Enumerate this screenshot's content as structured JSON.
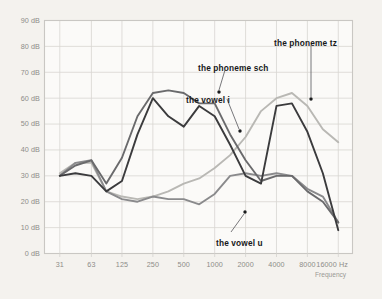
{
  "figure": {
    "background_color": "#f4f2ee",
    "plot_background_color": "#fbfaf8",
    "grid_color": "#d8d6d2",
    "border_color": "#c9c7c3"
  },
  "axes": {
    "y_unit": "dB",
    "y_ticks": [
      "0 dB",
      "10 dB",
      "20 dB",
      "30 dB",
      "40 dB",
      "50 dB",
      "60 dB",
      "70 dB",
      "80 dB",
      "90 dB"
    ],
    "y_values": [
      0,
      10,
      20,
      30,
      40,
      50,
      60,
      70,
      80,
      90
    ],
    "x_ticks": [
      "31",
      "63",
      "125",
      "250",
      "500",
      "1000",
      "2000",
      "4000",
      "8000",
      "16000 Hz"
    ],
    "x_values": [
      31,
      63,
      125,
      250,
      500,
      1000,
      2000,
      4000,
      8000,
      16000
    ],
    "x_axis_title": "Frequency"
  },
  "annotations": [
    {
      "id": "phoneme-tz",
      "text": "the phoneme tz",
      "text_x": 274,
      "text_y": 38,
      "point_x": 311,
      "point_y": 99,
      "leader": [
        [
          311,
          45
        ],
        [
          311,
          97
        ]
      ]
    },
    {
      "id": "phoneme-sch",
      "text": "the phoneme sch",
      "text_x": 198,
      "text_y": 63,
      "point_x": 219,
      "point_y": 92,
      "leader": [
        [
          225,
          70
        ],
        [
          219,
          90
        ]
      ]
    },
    {
      "id": "vowel-i",
      "text": "the vowel i",
      "text_x": 186,
      "text_y": 95,
      "point_x": 240,
      "point_y": 131,
      "leader": [
        [
          227,
          99
        ],
        [
          239,
          129
        ]
      ]
    },
    {
      "id": "vowel-u",
      "text": "the vowel u",
      "text_x": 216,
      "text_y": 238,
      "point_x": 245,
      "point_y": 212,
      "leader": [
        [
          231,
          232
        ],
        [
          244,
          214
        ]
      ]
    }
  ],
  "chart_data": {
    "type": "line",
    "title": "",
    "xlabel": "Frequency",
    "ylabel": "dB",
    "xscale": "log",
    "xlim": [
      22,
      22000
    ],
    "ylim": [
      0,
      90
    ],
    "grid": true,
    "legend": "inline-annotations",
    "categories": [
      31,
      44,
      63,
      88,
      125,
      177,
      250,
      354,
      500,
      707,
      1000,
      1414,
      2000,
      2828,
      4000,
      5657,
      8000,
      11314,
      16000
    ],
    "series": [
      {
        "name": "the phoneme sch",
        "color": "#3b3b3d",
        "width": 1.9,
        "values": [
          30,
          31,
          30,
          24,
          28,
          46,
          60,
          53,
          49,
          57,
          53,
          42,
          30,
          27,
          57,
          58,
          47,
          31,
          9
        ]
      },
      {
        "name": "the vowel i",
        "color": "#6a6a6c",
        "width": 1.9,
        "values": [
          30,
          34,
          36,
          27,
          37,
          53,
          62,
          63,
          62,
          58,
          58,
          46,
          36,
          28,
          30,
          30,
          24,
          20,
          12
        ]
      },
      {
        "name": "the vowel u",
        "color": "#8a8a8c",
        "width": 1.9,
        "values": [
          30,
          35,
          36,
          24,
          21,
          20,
          22,
          21,
          21,
          19,
          23,
          30,
          31,
          30,
          31,
          30,
          25,
          22,
          12
        ]
      },
      {
        "name": "the phoneme tz",
        "color": "#b9b8b4",
        "width": 1.9,
        "values": [
          31,
          35,
          35,
          24,
          22,
          21,
          22,
          24,
          27,
          29,
          33,
          38,
          45,
          55,
          60,
          62,
          57,
          48,
          43
        ]
      }
    ]
  }
}
